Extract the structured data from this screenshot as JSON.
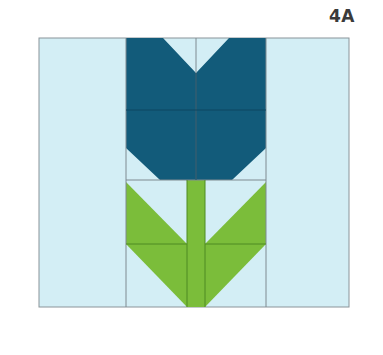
{
  "block": {
    "label": "4A",
    "name": "Tulip quilt block",
    "colors": {
      "background": "#d3eef5",
      "flower": "#125b7a",
      "stem_leaf": "#7bbd3a",
      "seam": "#7f8a90",
      "label": "#3a3a3a"
    },
    "pieces": [
      "flower-top-left",
      "flower-top-right",
      "flower-bottom-left",
      "flower-bottom-right",
      "stem",
      "leaf-left-upper",
      "leaf-left-lower",
      "leaf-right-upper",
      "leaf-right-lower"
    ]
  }
}
